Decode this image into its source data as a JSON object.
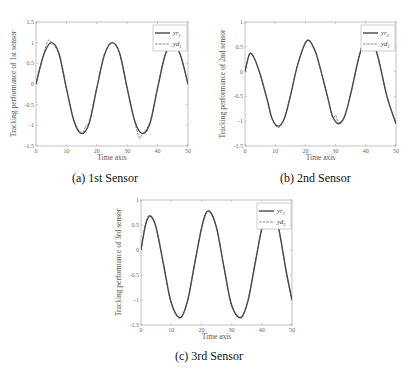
{
  "chart_data": [
    {
      "type": "line",
      "id": "a",
      "caption": "(a)  1st Sensor",
      "xlabel": "Time axis",
      "ylabel": "Tracking performance of 1st sensor",
      "xlim": [
        0,
        50
      ],
      "ylim": [
        -1.5,
        1.5
      ],
      "xticks": [
        0,
        10,
        20,
        30,
        40,
        50
      ],
      "yticks": [
        -1.5,
        -1,
        -0.5,
        0,
        0.5,
        1,
        1.5
      ],
      "legend": {
        "position": "upper right",
        "entries": [
          "yr1",
          "yd1"
        ]
      },
      "series": [
        {
          "name": "yr1",
          "style": "solid",
          "x": [
            0,
            2.5,
            5,
            7.5,
            10,
            12.5,
            15,
            17.5,
            20,
            22.5,
            25,
            27.5,
            30,
            32.5,
            35,
            37.5,
            40,
            42.5,
            45,
            47.5,
            50
          ],
          "y": [
            0,
            0.7,
            1.0,
            0.75,
            -0.1,
            -0.9,
            -1.2,
            -0.95,
            -0.1,
            0.7,
            1.0,
            0.75,
            -0.1,
            -0.9,
            -1.2,
            -0.95,
            -0.1,
            0.7,
            1.0,
            0.7,
            0
          ]
        },
        {
          "name": "yd1",
          "style": "dashed",
          "x": [
            0,
            2.5,
            4,
            5,
            7.5,
            10,
            12.5,
            15,
            16.5,
            17.5,
            20,
            22.5,
            25,
            27.5,
            30,
            32.5,
            34,
            35,
            37.5,
            40,
            42.5,
            45,
            47.5,
            50
          ],
          "y": [
            0,
            0.72,
            1.05,
            1.0,
            0.72,
            -0.12,
            -0.88,
            -1.18,
            -1.0,
            -0.93,
            -0.08,
            0.72,
            1.0,
            0.72,
            -0.12,
            -0.92,
            -1.3,
            -1.2,
            -0.92,
            -0.08,
            0.72,
            1.0,
            0.7,
            0
          ]
        }
      ]
    },
    {
      "type": "line",
      "id": "b",
      "caption": "(b)  2nd Sensor",
      "xlabel": "Time axis",
      "ylabel": "Tracking performance of 2nd sensor",
      "xlim": [
        0,
        50
      ],
      "ylim": [
        -1.5,
        1
      ],
      "xticks": [
        0,
        10,
        20,
        30,
        40,
        50
      ],
      "yticks": [
        -1.5,
        -1,
        -0.5,
        0,
        0.5,
        1
      ],
      "legend": {
        "position": "upper right",
        "entries": [
          "yr2",
          "yd2"
        ]
      },
      "series": [
        {
          "name": "yr2",
          "style": "solid",
          "x": [
            0,
            1.5,
            3,
            5,
            7.5,
            9,
            11,
            13,
            15,
            17.5,
            20.5,
            23,
            25,
            27.5,
            29,
            31,
            33,
            35,
            38,
            41,
            44,
            47,
            50
          ],
          "y": [
            0,
            0.35,
            0.28,
            -0.05,
            -0.6,
            -0.95,
            -1.1,
            -0.95,
            -0.5,
            0.15,
            0.62,
            0.45,
            0.05,
            -0.55,
            -0.9,
            -1.05,
            -0.9,
            -0.45,
            0.35,
            0.8,
            0.3,
            -0.5,
            -1.05
          ]
        },
        {
          "name": "yd2",
          "style": "dashed",
          "x": [
            0,
            1.5,
            3,
            5,
            7.5,
            9,
            11,
            13,
            15,
            17.5,
            20.5,
            23,
            25,
            27.5,
            29,
            30,
            31,
            33,
            35,
            38,
            41,
            44,
            47,
            48.5,
            50
          ],
          "y": [
            0,
            0.36,
            0.27,
            -0.06,
            -0.62,
            -0.96,
            -1.13,
            -0.94,
            -0.5,
            0.16,
            0.63,
            0.44,
            0.04,
            -0.56,
            -0.92,
            -0.88,
            -1.03,
            -0.9,
            -0.45,
            0.36,
            0.8,
            0.3,
            -0.5,
            -0.8,
            -1.06
          ]
        }
      ]
    },
    {
      "type": "line",
      "id": "c",
      "caption": "(c)  3rd Sensor",
      "xlabel": "Time axis",
      "ylabel": "Tracking performance of 3rd sensor",
      "xlim": [
        0,
        50
      ],
      "ylim": [
        -1.5,
        1
      ],
      "xticks": [
        0,
        10,
        20,
        30,
        40,
        50
      ],
      "yticks": [
        -1.5,
        -1,
        -0.5,
        0,
        0.5,
        1
      ],
      "legend": {
        "position": "upper right",
        "entries": [
          "yr3",
          "yd3"
        ]
      },
      "series": [
        {
          "name": "yr3",
          "style": "solid",
          "x": [
            0,
            1.5,
            3,
            5,
            7.5,
            10,
            13,
            15.5,
            18,
            20.5,
            22.5,
            25,
            27.5,
            30,
            33,
            35.5,
            38,
            40.5,
            43,
            45.5,
            48,
            50
          ],
          "y": [
            0,
            0.5,
            0.68,
            0.45,
            -0.3,
            -1.05,
            -1.35,
            -1.0,
            -0.2,
            0.55,
            0.78,
            0.45,
            -0.35,
            -1.1,
            -1.35,
            -1.0,
            -0.2,
            0.55,
            0.8,
            0.45,
            -0.4,
            -1.0
          ]
        },
        {
          "name": "yd3",
          "style": "dashed",
          "x": [
            0,
            1.5,
            3,
            5,
            7.5,
            10,
            13,
            15.5,
            18,
            20.5,
            22.5,
            25,
            27.5,
            30,
            33,
            34,
            35.5,
            38,
            40.5,
            43,
            45.5,
            48,
            50
          ],
          "y": [
            0,
            0.52,
            0.7,
            0.44,
            -0.32,
            -1.07,
            -1.37,
            -0.98,
            -0.18,
            0.56,
            0.79,
            0.44,
            -0.36,
            -1.12,
            -1.36,
            -1.28,
            -0.98,
            -0.18,
            0.56,
            0.81,
            0.44,
            -0.42,
            -1.02
          ]
        }
      ]
    }
  ],
  "panels": [
    {
      "caption": "(a)  1st Sensor",
      "xlabel": "Time axis",
      "ylabel": "Tracking performance of 1st sensor",
      "legend_solid": "yr",
      "legend_solid_sub": "1",
      "legend_dashed": "yd",
      "legend_dashed_sub": "1"
    },
    {
      "caption": "(b)  2nd Sensor",
      "xlabel": "Time axis",
      "ylabel": "Tracking performance of 2nd sensor",
      "legend_solid": "yr",
      "legend_solid_sub": "2",
      "legend_dashed": "yd",
      "legend_dashed_sub": "2"
    },
    {
      "caption": "(c)  3rd Sensor",
      "xlabel": "Time axis",
      "ylabel": "Tracking performance of 3rd sensor",
      "legend_solid": "yr",
      "legend_solid_sub": "3",
      "legend_dashed": "yd",
      "legend_dashed_sub": "3"
    }
  ],
  "colors": {
    "curve": "#4a4a4a",
    "axis": "#9a9a9a",
    "tick_text": "#666666",
    "caption": "#111111"
  }
}
